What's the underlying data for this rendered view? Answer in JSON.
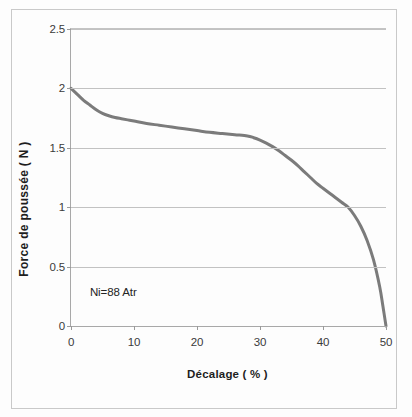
{
  "figure": {
    "caption_annotation": "Ni=88 Atr"
  },
  "chart_data": {
    "type": "line",
    "title": "",
    "subtitle": "",
    "xlabel": "Décalage ( % )",
    "ylabel": "Force de poussée ( N )",
    "xlim": [
      0,
      50
    ],
    "ylim": [
      0,
      2.5
    ],
    "grid": "horizontal",
    "legend": "none",
    "line_color": "#7b7b7b",
    "line_width_px": 3,
    "xticks": [
      0,
      10,
      20,
      30,
      40,
      50
    ],
    "xtick_labels": [
      "0",
      "10",
      "20",
      "30",
      "40",
      "50"
    ],
    "yticks": [
      0,
      0.5,
      1,
      1.5,
      2,
      2.5
    ],
    "ytick_labels": [
      "0",
      "0.5",
      "1",
      "1.5",
      "2",
      "2.5"
    ],
    "annotations": [
      {
        "text": "Ni=88 Atr",
        "x": 3.0,
        "y": 0.27
      }
    ],
    "series": [
      {
        "name": "Force de poussée",
        "x": [
          0,
          1,
          2,
          3,
          4,
          5,
          6,
          7,
          8,
          9,
          10,
          12,
          14,
          16,
          18,
          20,
          22,
          24,
          26,
          28,
          29,
          30,
          31,
          32,
          33,
          34,
          35,
          36,
          37,
          38,
          39,
          40,
          41,
          42,
          43,
          44,
          45,
          46,
          47,
          48,
          49,
          49.5,
          50
        ],
        "y": [
          2.0,
          1.95,
          1.9,
          1.86,
          1.82,
          1.79,
          1.77,
          1.755,
          1.745,
          1.735,
          1.725,
          1.705,
          1.69,
          1.675,
          1.66,
          1.645,
          1.63,
          1.62,
          1.61,
          1.6,
          1.585,
          1.565,
          1.54,
          1.51,
          1.475,
          1.435,
          1.395,
          1.35,
          1.3,
          1.25,
          1.2,
          1.16,
          1.12,
          1.08,
          1.04,
          1.0,
          0.93,
          0.84,
          0.72,
          0.56,
          0.33,
          0.17,
          0.0
        ]
      }
    ]
  }
}
